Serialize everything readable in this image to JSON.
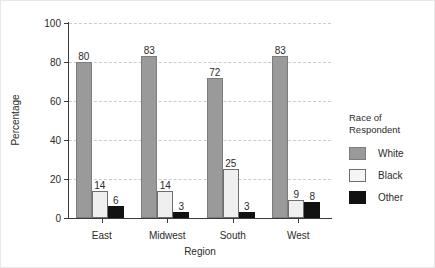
{
  "chart_data": {
    "type": "bar",
    "title": "",
    "xlabel": "Region",
    "ylabel": "Percentage",
    "categories": [
      "East",
      "Midwest",
      "South",
      "West"
    ],
    "series": [
      {
        "name": "White",
        "color": "#9a9a9a",
        "values": [
          80,
          83,
          72,
          83
        ]
      },
      {
        "name": "Black",
        "color": "#efefef",
        "values": [
          14,
          14,
          25,
          9
        ]
      },
      {
        "name": "Other",
        "color": "#111111",
        "values": [
          6,
          3,
          3,
          8
        ]
      }
    ],
    "ylim": [
      0,
      100
    ],
    "yticks": [
      0,
      20,
      40,
      60,
      80,
      100
    ],
    "grid": true,
    "data_labels": true,
    "legend": {
      "title": "Race of\nRespondent",
      "position": "right",
      "entries": [
        "White",
        "Black",
        "Other"
      ]
    }
  }
}
